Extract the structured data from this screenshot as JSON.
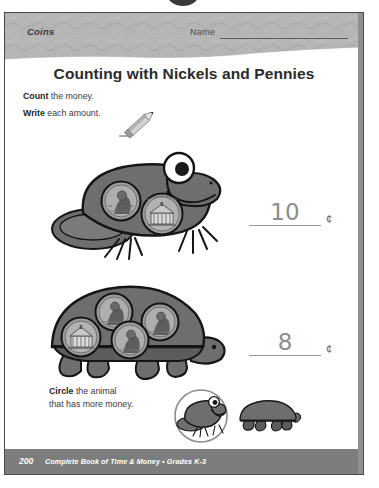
{
  "worksheet": {
    "header": {
      "section_label": "Coins",
      "name_label": "Name"
    },
    "title": "Counting with Nickels and Pennies",
    "instructions": [
      {
        "bold": "Count",
        "rest": " the money."
      },
      {
        "bold": "Write",
        "rest": " each amount."
      }
    ],
    "pencil_icon": "pencil-icon",
    "problems": [
      {
        "animal": "frog",
        "coins": [
          {
            "type": "penny",
            "value": 1
          },
          {
            "type": "nickel",
            "value": 5
          }
        ],
        "answer": "10",
        "unit": "¢"
      },
      {
        "animal": "turtle",
        "coins": [
          {
            "type": "nickel",
            "value": 5
          },
          {
            "type": "penny",
            "value": 1
          },
          {
            "type": "penny",
            "value": 1
          },
          {
            "type": "penny",
            "value": 1
          }
        ],
        "answer": "8",
        "unit": "¢"
      }
    ],
    "bottom_task": {
      "bold": "Circle",
      "line1_rest": " the animal",
      "line2": "that has more money.",
      "choices": [
        {
          "animal": "frog",
          "circled": true
        },
        {
          "animal": "turtle",
          "circled": false
        }
      ]
    },
    "footer": {
      "page_number": "200",
      "book_title": "Complete Book of Time & Money  •  Grades K-3"
    },
    "colors": {
      "header_band": "#b4b4b4",
      "footer_band": "#7d7d7d",
      "animal_body": "#6e6e6e",
      "animal_outline": "#1a1a1a",
      "handwriting": "#8d8d8d",
      "text": "#2b2b2b"
    }
  }
}
